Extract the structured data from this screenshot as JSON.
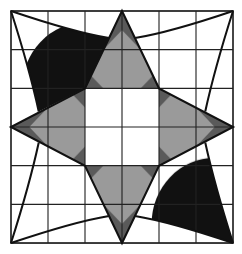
{
  "figure": {
    "grid": {
      "rows": 6,
      "cols": 6
    },
    "colors": {
      "background": "#ffffff",
      "line": "#1a1a1a",
      "star_fill": "#8a8a8a",
      "dot": "#111111"
    },
    "regions": [
      {
        "name": "outer-grid",
        "fill": "none"
      },
      {
        "name": "star",
        "fill": "crosshatch-gray"
      },
      {
        "name": "center-square",
        "fill": "white"
      },
      {
        "name": "corner-top-left",
        "fill": "dotted"
      },
      {
        "name": "corner-top-right",
        "fill": "dotted"
      },
      {
        "name": "corner-bottom-left",
        "fill": "dotted"
      },
      {
        "name": "corner-bottom-right",
        "fill": "dotted"
      }
    ]
  }
}
